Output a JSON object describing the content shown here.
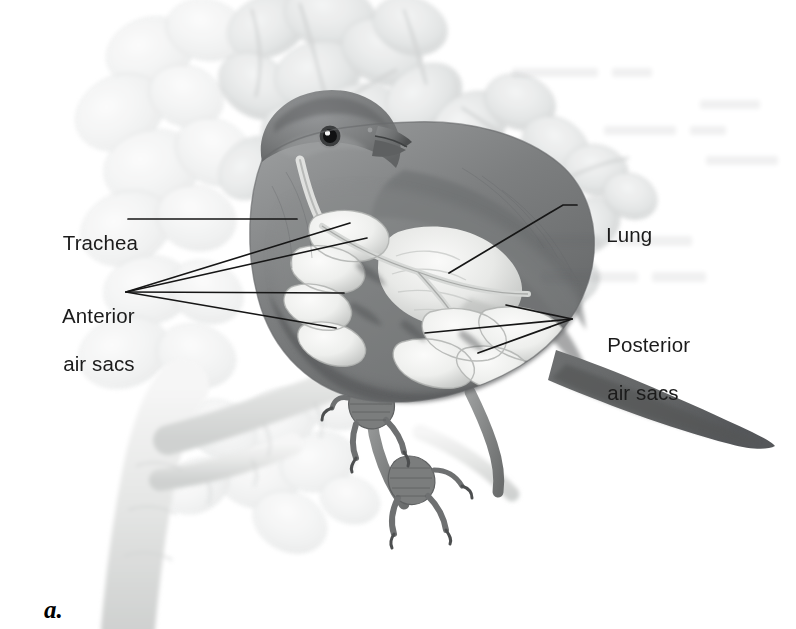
{
  "figure": {
    "panel_letter": "a.",
    "caption_alt": "Cutaway illustration of a perching songbird showing the respiratory system: trachea, lungs, anterior air sacs and posterior air sacs."
  },
  "labels": [
    {
      "id": "trachea",
      "text": "Trachea",
      "text2": "",
      "x": 40,
      "y": 208,
      "align": "left"
    },
    {
      "id": "anterior",
      "text": "Anterior",
      "text2": "air sacs",
      "x": 40,
      "y": 281,
      "align": "left"
    },
    {
      "id": "lung",
      "text": "Lung",
      "text2": "",
      "x": 583,
      "y": 200,
      "align": "left"
    },
    {
      "id": "posterior",
      "text": "Posterior",
      "text2": "air sacs",
      "x": 584,
      "y": 310,
      "align": "left"
    }
  ],
  "leader_lines": [
    {
      "id": "trachea-leader",
      "points": "128,219 297,219"
    },
    {
      "id": "anterior-leader-1",
      "points": "126,292 350,223"
    },
    {
      "id": "anterior-leader-2",
      "points": "126,292 367,238"
    },
    {
      "id": "anterior-leader-3",
      "points": "126,292 344,293"
    },
    {
      "id": "anterior-leader-4",
      "points": "126,292 336,328"
    },
    {
      "id": "lung-leader",
      "points": "449,273 563,205 577,205"
    },
    {
      "id": "posterior-leader-1",
      "points": "572,319 506,305"
    },
    {
      "id": "posterior-leader-2",
      "points": "572,319 425,333"
    },
    {
      "id": "posterior-leader-3",
      "points": "572,319 478,353"
    }
  ],
  "colors": {
    "label_text": "#1b1b1b",
    "leader_line": "#161616",
    "page_background": "#ffffff",
    "foliage_light": "#e9eaea",
    "foliage_mid": "#d2d4d4",
    "branch": "#e3e4e3",
    "bird_body_dark": "#6f7172",
    "bird_body_mid": "#8d8f90",
    "bird_head": "#7b7d7e",
    "air_sac_light": "#f2f2f0",
    "air_sac_shade": "#c9cbc9",
    "lung_light": "#ececeb",
    "tail_dark": "#636566"
  },
  "anatomy_parts": [
    {
      "id": "trachea",
      "name": "Trachea"
    },
    {
      "id": "lung",
      "name": "Lung"
    },
    {
      "id": "anterior-air-sacs",
      "name": "Anterior air sacs"
    },
    {
      "id": "posterior-air-sacs",
      "name": "Posterior air sacs"
    }
  ]
}
